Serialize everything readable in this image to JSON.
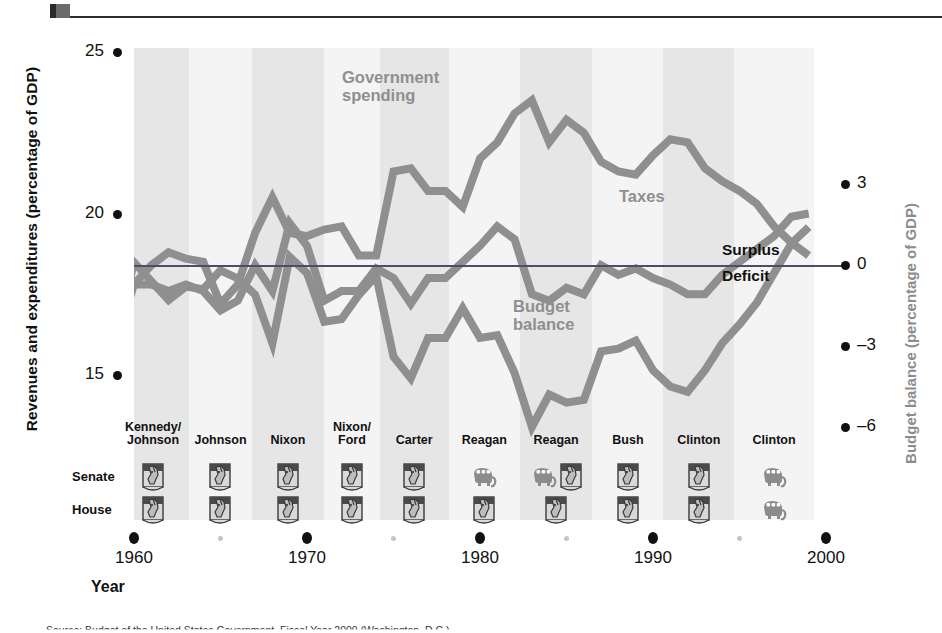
{
  "figure": {
    "y_axis_left_title": "Revenues and expenditures (percentage of GDP)",
    "y_axis_right_title": "Budget balance (percentage of GDP)",
    "x_axis_title": "Year",
    "surplus_label": "Surplus",
    "deficit_label": "Deficit",
    "source_note": "Source: Budget of the United States Government, Fiscal Year 2000 (Washington, D.C.)",
    "colors": {
      "series_line": "#8f8f8f",
      "band": "#e6e6e6",
      "zero_line": "#4d4d63",
      "axis_text": "#111111",
      "right_axis_title": "#8c8c8c",
      "donkey": "#9a9a9a",
      "elephant": "#8c8c8c"
    }
  },
  "chart_data": {
    "type": "line",
    "title": "",
    "xlabel": "Year",
    "ylabel": "Revenues and expenditures (percentage of GDP)",
    "ylabel_right": "Budget balance (percentage of GDP)",
    "xlim": [
      1959,
      1999
    ],
    "ylim": [
      14.2,
      25.6
    ],
    "ylim_right": [
      -7.3,
      4.0
    ],
    "grid": false,
    "legend": "inline-annotations",
    "left_ticks": [
      25,
      20,
      15
    ],
    "right_ticks": [
      3,
      0,
      -3,
      -6
    ],
    "x_ticks": [
      1960,
      1970,
      1980,
      1990,
      2000
    ],
    "x_minor_ticks": [
      1965,
      1975,
      1985,
      1995
    ],
    "x": [
      1959,
      1960,
      1961,
      1962,
      1963,
      1964,
      1965,
      1966,
      1967,
      1968,
      1969,
      1970,
      1971,
      1972,
      1973,
      1974,
      1975,
      1976,
      1977,
      1978,
      1979,
      1980,
      1981,
      1982,
      1983,
      1984,
      1985,
      1986,
      1987,
      1988,
      1989,
      1990,
      1991,
      1992,
      1993,
      1994,
      1995,
      1996,
      1997,
      1998,
      1999
    ],
    "series": [
      {
        "name": "Government spending",
        "axis": "left",
        "unit": "percentage of GDP",
        "values": [
          18.8,
          17.8,
          18.4,
          18.8,
          18.6,
          18.5,
          17.2,
          17.8,
          19.4,
          20.5,
          19.4,
          19.3,
          19.5,
          19.6,
          18.7,
          18.7,
          21.3,
          21.4,
          20.7,
          20.7,
          20.2,
          21.7,
          22.2,
          23.1,
          23.5,
          22.2,
          22.9,
          22.5,
          21.6,
          21.3,
          21.2,
          21.8,
          22.3,
          22.2,
          21.4,
          21.0,
          20.7,
          20.3,
          19.6,
          19.1,
          18.7
        ]
      },
      {
        "name": "Taxes",
        "axis": "left",
        "unit": "percentage of GDP",
        "values": [
          16.1,
          17.8,
          17.8,
          17.6,
          17.8,
          17.6,
          17.0,
          17.3,
          18.4,
          17.6,
          19.7,
          19.0,
          17.3,
          17.6,
          17.6,
          18.3,
          18.0,
          17.2,
          18.0,
          18.0,
          18.5,
          19.0,
          19.6,
          19.2,
          17.5,
          17.3,
          17.7,
          17.5,
          18.4,
          18.1,
          18.3,
          18.0,
          17.8,
          17.5,
          17.5,
          18.1,
          18.5,
          18.9,
          19.3,
          19.9,
          20.0
        ]
      },
      {
        "name": "Budget balance",
        "axis": "right",
        "unit": "percentage of GDP",
        "values": [
          -2.6,
          0.1,
          -0.6,
          -1.3,
          -0.8,
          -0.9,
          -0.2,
          -0.5,
          -1.1,
          -2.9,
          0.3,
          -0.3,
          -2.1,
          -2.0,
          -1.1,
          -0.4,
          -3.4,
          -4.2,
          -2.7,
          -2.7,
          -1.6,
          -2.7,
          -2.6,
          -4.0,
          -6.0,
          -4.8,
          -5.1,
          -5.0,
          -3.2,
          -3.1,
          -2.8,
          -3.9,
          -4.5,
          -4.7,
          -3.9,
          -2.9,
          -2.2,
          -1.4,
          -0.3,
          0.8,
          1.4
        ]
      }
    ],
    "annotations": [
      {
        "text": "Government spending",
        "x": 1974,
        "y": 24.2
      },
      {
        "text": "Taxes",
        "x": 1982,
        "y": 20.6
      },
      {
        "text": "Budget balance",
        "x": 1981,
        "y": 16.8
      },
      {
        "text": "Surplus",
        "x": 1994,
        "y": 18.7
      },
      {
        "text": "Deficit",
        "x": 1994,
        "y": 18.1
      }
    ]
  },
  "congress_table": {
    "row_labels": [
      "Senate",
      "House"
    ],
    "columns": [
      {
        "president": "Kennedy/\nJohnson",
        "senate": [
          "donkey"
        ],
        "house": [
          "donkey"
        ]
      },
      {
        "president": "Johnson",
        "senate": [
          "donkey"
        ],
        "house": [
          "donkey"
        ]
      },
      {
        "president": "Nixon",
        "senate": [
          "donkey"
        ],
        "house": [
          "donkey"
        ]
      },
      {
        "president": "Nixon/\nFord",
        "senate": [
          "donkey"
        ],
        "house": [
          "donkey"
        ]
      },
      {
        "president": "Carter",
        "senate": [
          "donkey"
        ],
        "house": [
          "donkey"
        ]
      },
      {
        "president": "Reagan",
        "senate": [
          "elephant"
        ],
        "house": [
          "donkey"
        ]
      },
      {
        "president": "Reagan",
        "senate": [
          "elephant",
          "donkey"
        ],
        "house": [
          "donkey"
        ]
      },
      {
        "president": "Bush",
        "senate": [
          "donkey"
        ],
        "house": [
          "donkey"
        ]
      },
      {
        "president": "Clinton",
        "senate": [
          "donkey"
        ],
        "house": [
          "donkey"
        ]
      },
      {
        "president": "Clinton",
        "senate": [
          "elephant"
        ],
        "house": [
          "elephant"
        ]
      }
    ]
  }
}
